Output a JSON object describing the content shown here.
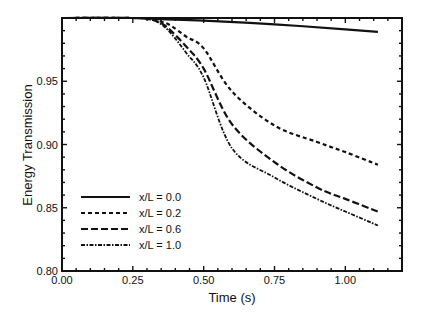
{
  "chart_data": {
    "type": "line",
    "title": "",
    "xlabel": "Time (s)",
    "ylabel": "Energy Transmission",
    "xlim": [
      0.0,
      1.2
    ],
    "ylim": [
      0.8,
      1.0
    ],
    "x_ticks": [
      "0.00",
      "0.25",
      "0.50",
      "0.75",
      "1.00"
    ],
    "x_tick_values": [
      0.0,
      0.25,
      0.5,
      0.75,
      1.0
    ],
    "y_ticks": [
      "0.80",
      "0.85",
      "0.90",
      "0.95"
    ],
    "y_tick_values": [
      0.8,
      0.85,
      0.9,
      0.95
    ],
    "grid": false,
    "legend_position": "lower left",
    "series": [
      {
        "name": "x/L = 0.0",
        "style": "solid",
        "x": [
          0.0,
          0.25,
          0.35,
          0.5,
          0.75,
          1.0,
          1.115
        ],
        "y": [
          1.0,
          1.0,
          0.999,
          0.998,
          0.995,
          0.991,
          0.989
        ]
      },
      {
        "name": "x/L = 0.2",
        "style": "dotted",
        "x": [
          0.0,
          0.25,
          0.31,
          0.35,
          0.384,
          0.44,
          0.5,
          0.6,
          0.75,
          0.9,
          1.0,
          1.115
        ],
        "y": [
          1.0,
          1.0,
          0.999,
          0.997,
          0.994,
          0.985,
          0.976,
          0.942,
          0.915,
          0.902,
          0.894,
          0.884
        ]
      },
      {
        "name": "x/L = 0.6",
        "style": "dashed",
        "x": [
          0.0,
          0.25,
          0.31,
          0.35,
          0.384,
          0.44,
          0.5,
          0.6,
          0.75,
          0.9,
          1.0,
          1.115
        ],
        "y": [
          1.0,
          1.0,
          0.999,
          0.996,
          0.99,
          0.977,
          0.96,
          0.916,
          0.886,
          0.866,
          0.857,
          0.847
        ]
      },
      {
        "name": "x/L = 1.0",
        "style": "dashdot",
        "x": [
          0.0,
          0.25,
          0.31,
          0.35,
          0.384,
          0.44,
          0.5,
          0.6,
          0.75,
          0.9,
          1.0,
          1.115
        ],
        "y": [
          1.0,
          1.0,
          0.999,
          0.995,
          0.988,
          0.972,
          0.953,
          0.897,
          0.874,
          0.857,
          0.847,
          0.836
        ]
      }
    ]
  }
}
